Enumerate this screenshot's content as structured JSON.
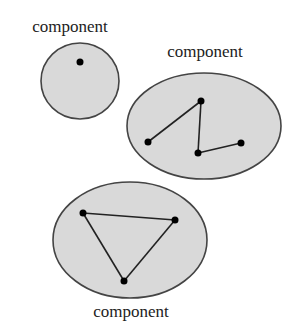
{
  "diagram": {
    "components": [
      {
        "label": "component",
        "shape": {
          "cx": 80,
          "cy": 81,
          "rx": 39,
          "ry": 38
        },
        "label_pos": {
          "x": 70,
          "y": 32
        },
        "nodes": [
          {
            "x": 80,
            "y": 62
          }
        ],
        "edges": []
      },
      {
        "label": "component",
        "shape": {
          "cx": 204,
          "cy": 126,
          "rx": 77,
          "ry": 53
        },
        "label_pos": {
          "x": 205,
          "y": 57
        },
        "nodes": [
          {
            "x": 148,
            "y": 142
          },
          {
            "x": 201,
            "y": 101
          },
          {
            "x": 198,
            "y": 153
          },
          {
            "x": 241,
            "y": 143
          }
        ],
        "edges": [
          [
            0,
            1
          ],
          [
            1,
            2
          ],
          [
            2,
            3
          ]
        ]
      },
      {
        "label": "component",
        "shape": {
          "cx": 130,
          "cy": 240,
          "rx": 77,
          "ry": 58
        },
        "label_pos": {
          "x": 131,
          "y": 317
        },
        "nodes": [
          {
            "x": 83,
            "y": 213
          },
          {
            "x": 175,
            "y": 220
          },
          {
            "x": 124,
            "y": 281
          }
        ],
        "edges": [
          [
            0,
            1
          ],
          [
            1,
            2
          ],
          [
            2,
            0
          ]
        ]
      }
    ],
    "colors": {
      "fill": "#d9d9d9",
      "stroke": "#444444",
      "node": "#000000"
    }
  }
}
